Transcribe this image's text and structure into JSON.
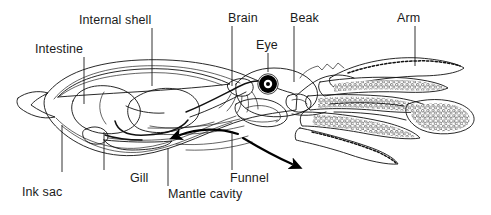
{
  "figure": {
    "background_color": "#ffffff",
    "line_color": "#111111",
    "text_color": "#1b1b1b"
  },
  "labels": {
    "intestine": "Intestine",
    "internal_shell": "Internal shell",
    "brain": "Brain",
    "eye": "Eye",
    "beak": "Beak",
    "arm": "Arm",
    "ink_sac": "Ink sac",
    "gill": "Gill",
    "mantle_cavity": "Mantle cavity",
    "funnel": "Funnel"
  },
  "parts": {
    "mantle": {
      "name": "mantle",
      "fill": "#ffffff"
    },
    "internal_shell": {
      "name": "internal-shell",
      "fill": "#d8d8d8",
      "hatch": "diagonal"
    },
    "digestive_gland": {
      "name": "digestive-gland",
      "fill": "#9a9a9a"
    },
    "gonad": {
      "name": "gonad",
      "fill": "#8e8e8e",
      "texture": "stipple"
    },
    "ink_sac": {
      "name": "ink-sac",
      "fill": "#2a2a2a"
    },
    "gill": {
      "name": "gill",
      "fill": "#bdbdbd"
    },
    "eye": {
      "name": "eye",
      "fill": "#000000",
      "pupil_fill": "#ffffff"
    },
    "funnel": {
      "name": "funnel",
      "fill": "#ffffff"
    },
    "arms": {
      "name": "arms",
      "count": 8,
      "sucker_fill": "#ffffff"
    },
    "tentacle_club": {
      "name": "tentacle-club",
      "fill": "#ffffff"
    },
    "fin": {
      "name": "tail-fin",
      "fill": "#ffffff"
    }
  },
  "flow_arrows": {
    "intake": {
      "name": "water-intake-arrow",
      "direction": "left"
    },
    "jet": {
      "name": "jet-expulsion-arrow",
      "direction": "down-right"
    }
  }
}
